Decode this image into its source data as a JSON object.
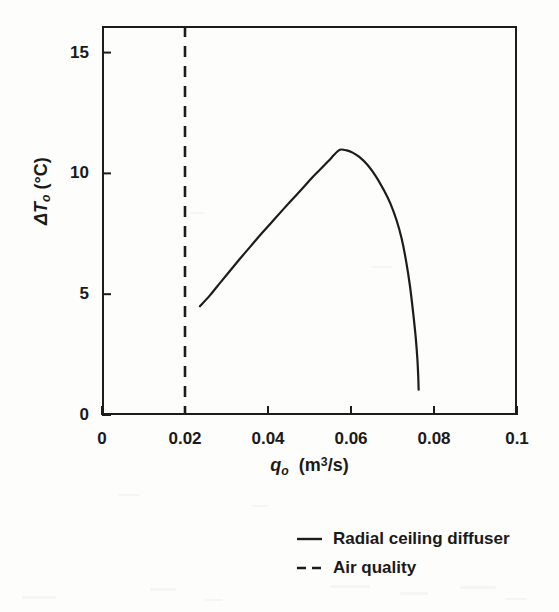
{
  "figure": {
    "background_color": "#fdfdfc",
    "ink_color": "#1c1c1c"
  },
  "axes": {
    "y_title_prefix": "Δ",
    "y_title_var": "T",
    "y_title_sub": "o",
    "y_title_units": "(°C)",
    "x_title_var": "q",
    "x_title_sub": "o",
    "x_title_units_open": "(m",
    "x_title_units_sup": "3",
    "x_title_units_close": "/s)",
    "x_ticks": [
      "0",
      "0.02",
      "0.04",
      "0.06",
      "0.08",
      "0.1"
    ],
    "y_ticks": [
      "0",
      "5",
      "10",
      "15"
    ]
  },
  "legend": {
    "items": [
      {
        "label": "Radial ceiling diffuser",
        "style": "solid",
        "color": "#1c1c1c"
      },
      {
        "label": "Air quality",
        "style": "dashed",
        "color": "#1c1c1c"
      }
    ]
  },
  "chart_data": {
    "type": "line",
    "title": "",
    "subtitle": "",
    "xlabel": "q_o  (m³/s)",
    "ylabel": "ΔT_o  (°C)",
    "xlim": [
      0,
      0.1
    ],
    "ylim": [
      0,
      16.1
    ],
    "xticks": [
      0,
      0.02,
      0.04,
      0.06,
      0.08,
      0.1
    ],
    "yticks": [
      0,
      5,
      10,
      15
    ],
    "grid": false,
    "legend_position": "below-right",
    "series": [
      {
        "name": "Radial ceiling diffuser",
        "style": "solid",
        "color": "#1c1c1c",
        "x": [
          0.0236,
          0.026,
          0.0285,
          0.031,
          0.0335,
          0.036,
          0.0385,
          0.041,
          0.0435,
          0.046,
          0.0485,
          0.0505,
          0.0525,
          0.0545,
          0.056,
          0.0573,
          0.059,
          0.0605,
          0.062,
          0.064,
          0.066,
          0.068,
          0.0695,
          0.071,
          0.0722,
          0.0733,
          0.0742,
          0.075,
          0.0756,
          0.076,
          0.0762,
          0.0763
        ],
        "y": [
          4.5,
          4.95,
          5.48,
          6.0,
          6.52,
          7.02,
          7.52,
          8.0,
          8.48,
          8.95,
          9.42,
          9.8,
          10.15,
          10.5,
          10.78,
          10.98,
          10.95,
          10.85,
          10.68,
          10.35,
          9.88,
          9.28,
          8.75,
          8.05,
          7.3,
          6.35,
          5.35,
          4.2,
          3.2,
          2.3,
          1.6,
          1.05
        ]
      },
      {
        "name": "Air quality",
        "style": "dashed",
        "color": "#1c1c1c",
        "type": "vertical-line",
        "x_value": 0.02,
        "y_range": [
          0,
          16.1
        ]
      }
    ],
    "annotations": []
  }
}
